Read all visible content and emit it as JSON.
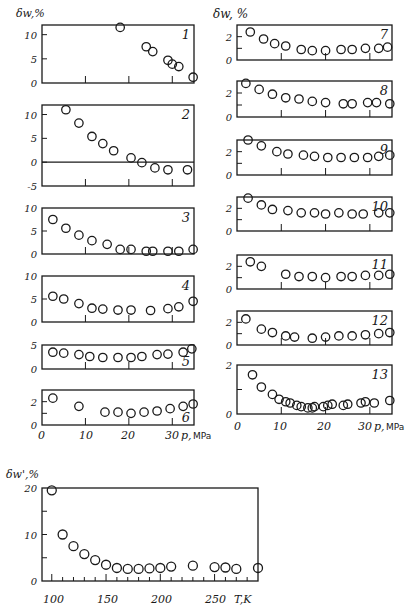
{
  "figure": {
    "left_column_ylabel": "δw,%",
    "right_column_ylabel": "δw, %",
    "bottom_ylabel": "δw',%",
    "pressure_axis": {
      "ticks": [
        "0",
        "10",
        "20",
        "30"
      ],
      "label": "p,",
      "unit": "MPa"
    },
    "temperature_axis": {
      "ticks": [
        "100",
        "150",
        "200",
        "250"
      ],
      "label": "T,K"
    }
  },
  "chart_data": [
    {
      "type": "scatter",
      "panel": "1",
      "xlabel": "p, MPa",
      "ylabel": "δw, %",
      "xlim": [
        0,
        35
      ],
      "ylim": [
        0,
        12
      ],
      "yticks": [
        "0",
        "5",
        "10"
      ],
      "x": [
        18,
        24,
        25.5,
        29,
        30,
        31.5,
        34.8
      ],
      "y": [
        11.5,
        7.5,
        6.5,
        4.7,
        3.9,
        3.4,
        1.2
      ]
    },
    {
      "type": "scatter",
      "panel": "2",
      "xlabel": "p, MPa",
      "ylabel": "δw, %",
      "xlim": [
        0,
        35
      ],
      "ylim": [
        -5,
        12
      ],
      "yticks": [
        "-5",
        "0",
        "5",
        "10"
      ],
      "zero_line": true,
      "x": [
        5.5,
        8.5,
        11.5,
        14,
        16.5,
        20.5,
        23,
        26,
        29,
        33.5
      ],
      "y": [
        11,
        8.2,
        5.4,
        3.9,
        2.4,
        0.9,
        -0.1,
        -1.2,
        -1.6,
        -1.6
      ]
    },
    {
      "type": "scatter",
      "panel": "3",
      "xlabel": "p, MPa",
      "ylabel": "δw, %",
      "xlim": [
        0,
        35
      ],
      "ylim": [
        0,
        10
      ],
      "yticks": [
        "0",
        "5",
        "10"
      ],
      "x": [
        2.5,
        5.5,
        8.5,
        11.5,
        15,
        18,
        20.5,
        24,
        25.5,
        29,
        31.5,
        34.8
      ],
      "y": [
        7.5,
        5.6,
        4.1,
        2.9,
        2.1,
        1.0,
        1.0,
        0.6,
        0.6,
        0.6,
        0.6,
        1.0
      ]
    },
    {
      "type": "scatter",
      "panel": "4",
      "xlabel": "p, MPa",
      "ylabel": "δw, %",
      "xlim": [
        0,
        35
      ],
      "ylim": [
        0,
        10
      ],
      "yticks": [
        "0",
        "5",
        "10"
      ],
      "x": [
        2.5,
        5,
        8.5,
        11.5,
        14,
        17.5,
        20.5,
        25,
        29,
        31.5,
        34.8
      ],
      "y": [
        5.6,
        5.0,
        4.0,
        3.0,
        2.8,
        2.6,
        2.6,
        2.5,
        2.9,
        3.3,
        4.5
      ]
    },
    {
      "type": "scatter",
      "panel": "5",
      "xlabel": "p, MPa",
      "ylabel": "δw, %",
      "xlim": [
        0,
        35
      ],
      "ylim": [
        0,
        5
      ],
      "yticks": [
        "0",
        "5"
      ],
      "x": [
        2.5,
        5,
        8.5,
        11,
        14,
        17.5,
        20.5,
        23,
        26.5,
        29,
        32.5,
        34.5
      ],
      "y": [
        3.5,
        3.3,
        3.0,
        2.6,
        2.4,
        2.4,
        2.4,
        2.6,
        3.0,
        3.1,
        3.5,
        4.2
      ]
    },
    {
      "type": "scatter",
      "panel": "6",
      "xlabel": "p, MPa",
      "ylabel": "δw, %",
      "xlim": [
        0,
        35
      ],
      "ylim": [
        0,
        3
      ],
      "yticks": [
        "0",
        "2"
      ],
      "x": [
        2.5,
        8.5,
        14.5,
        17.5,
        20.5,
        23.5,
        26.5,
        29.5,
        32.5,
        34.8
      ],
      "y": [
        2.3,
        1.6,
        1.1,
        1.1,
        1.0,
        1.1,
        1.2,
        1.4,
        1.6,
        1.8
      ]
    },
    {
      "type": "scatter",
      "panel": "7",
      "xlabel": "p, MPa",
      "ylabel": "δw, %",
      "xlim": [
        0,
        35
      ],
      "ylim": [
        0,
        3
      ],
      "yticks": [
        "0",
        "2"
      ],
      "x": [
        3,
        6,
        8.5,
        11,
        14.5,
        17,
        20,
        23.5,
        26,
        29,
        32,
        34
      ],
      "y": [
        2.4,
        1.8,
        1.4,
        1.2,
        0.9,
        0.8,
        0.8,
        0.9,
        0.9,
        1.0,
        1.0,
        1.1
      ]
    },
    {
      "type": "scatter",
      "panel": "8",
      "xlabel": "p, MPa",
      "ylabel": "δw, %",
      "xlim": [
        0,
        35
      ],
      "ylim": [
        0,
        3
      ],
      "yticks": [
        "0",
        "2"
      ],
      "x": [
        2,
        5,
        8,
        11,
        14,
        17,
        20,
        24,
        26,
        29.5,
        31.5,
        34.5
      ],
      "y": [
        2.8,
        2.3,
        1.9,
        1.6,
        1.5,
        1.3,
        1.2,
        1.1,
        1.1,
        1.2,
        1.2,
        1.1
      ]
    },
    {
      "type": "scatter",
      "panel": "9",
      "xlabel": "p, MPa",
      "ylabel": "δw, %",
      "xlim": [
        0,
        35
      ],
      "ylim": [
        0,
        3
      ],
      "yticks": [
        "0",
        "2"
      ],
      "x": [
        2.5,
        5.5,
        9,
        11.5,
        15,
        17.5,
        20.5,
        23.5,
        26.5,
        29.5,
        32,
        34.5
      ],
      "y": [
        3.0,
        2.5,
        2.0,
        1.8,
        1.7,
        1.6,
        1.5,
        1.5,
        1.5,
        1.5,
        1.6,
        1.7
      ]
    },
    {
      "type": "scatter",
      "panel": "10",
      "xlabel": "p, MPa",
      "ylabel": "δw, %",
      "xlim": [
        0,
        35
      ],
      "ylim": [
        0,
        3
      ],
      "yticks": [
        "0",
        "2"
      ],
      "x": [
        2.5,
        5.5,
        8,
        11.5,
        14.5,
        17.5,
        20,
        23,
        26,
        28.5,
        32,
        34.5
      ],
      "y": [
        2.9,
        2.3,
        1.9,
        1.8,
        1.6,
        1.6,
        1.5,
        1.6,
        1.5,
        1.5,
        1.6,
        1.6
      ]
    },
    {
      "type": "scatter",
      "panel": "11",
      "xlabel": "p, MPa",
      "ylabel": "δw, %",
      "xlim": [
        0,
        35
      ],
      "ylim": [
        0,
        3
      ],
      "yticks": [
        "0",
        "2"
      ],
      "x": [
        3,
        5.5,
        11,
        14,
        17,
        20,
        23.5,
        26,
        29,
        32,
        34.5
      ],
      "y": [
        2.4,
        2.0,
        1.3,
        1.1,
        1.1,
        1.0,
        1.1,
        1.1,
        1.2,
        1.2,
        1.3
      ]
    },
    {
      "type": "scatter",
      "panel": "12",
      "xlabel": "p, MPa",
      "ylabel": "δw, %",
      "xlim": [
        0,
        35
      ],
      "ylim": [
        0,
        3
      ],
      "yticks": [
        "0",
        "2"
      ],
      "x": [
        2,
        5.5,
        8,
        11,
        13,
        17,
        20,
        23,
        26,
        29,
        32,
        34.5
      ],
      "y": [
        2.3,
        1.4,
        1.1,
        0.8,
        0.7,
        0.6,
        0.7,
        0.8,
        0.8,
        0.9,
        1.0,
        1.1
      ]
    },
    {
      "type": "scatter",
      "panel": "13",
      "xlabel": "p, MPa",
      "ylabel": "δw, %",
      "xlim": [
        0,
        35
      ],
      "ylim": [
        0,
        2
      ],
      "yticks": [
        "0",
        "2"
      ],
      "x": [
        3.5,
        5.5,
        8,
        9.5,
        11,
        12,
        13.5,
        14.5,
        16,
        17,
        17.5,
        19.5,
        20.5,
        21.5,
        24,
        25,
        28,
        29,
        31,
        34.5
      ],
      "y": [
        1.6,
        1.1,
        0.8,
        0.6,
        0.5,
        0.45,
        0.35,
        0.3,
        0.25,
        0.25,
        0.3,
        0.3,
        0.35,
        0.4,
        0.35,
        0.4,
        0.45,
        0.5,
        0.45,
        0.55
      ]
    },
    {
      "type": "scatter",
      "panel": "T",
      "xlabel": "T, K",
      "ylabel": "δw', %",
      "xlim": [
        91,
        290
      ],
      "ylim": [
        0,
        20
      ],
      "xticks": [
        "100",
        "150",
        "200",
        "250"
      ],
      "yticks": [
        "0",
        "10",
        "20"
      ],
      "x": [
        100,
        110,
        120,
        130,
        140,
        150,
        160,
        170,
        180,
        190,
        200,
        210,
        230,
        250,
        260,
        270,
        290
      ],
      "y": [
        19.5,
        10,
        7.5,
        5.8,
        4.5,
        3.5,
        2.8,
        2.6,
        2.6,
        2.7,
        2.8,
        3.1,
        3.3,
        3.0,
        2.9,
        2.6,
        2.8
      ]
    }
  ]
}
